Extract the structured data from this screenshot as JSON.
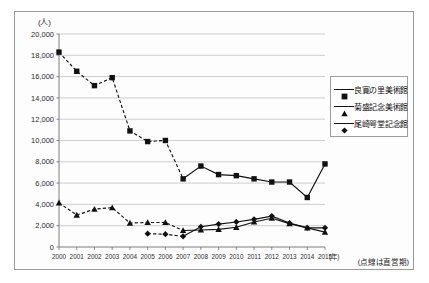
{
  "chart_data": {
    "type": "line",
    "title": "",
    "xlabel": "年",
    "ylabel": "人",
    "y_unit_label": "(人)",
    "x_unit_label": "(年)",
    "ylim": [
      0,
      20000
    ],
    "ytick_step": 2000,
    "grid": true,
    "legend_position": "right",
    "annotation": "(点線は直線期)",
    "note": "(点線は直営期)",
    "categories": [
      "2000",
      "2001",
      "2002",
      "2003",
      "2004",
      "2005",
      "2006",
      "2007",
      "2008",
      "2009",
      "2010",
      "2011",
      "2012",
      "2013",
      "2014",
      "2015"
    ],
    "ytick_labels": [
      "0",
      "2,000",
      "4,000",
      "6,000",
      "8,000",
      "10,000",
      "12,000",
      "14,000",
      "16,000",
      "18,000",
      "20,000"
    ],
    "ytick_values": [
      0,
      2000,
      4000,
      6000,
      8000,
      10000,
      12000,
      14000,
      16000,
      18000,
      20000
    ],
    "dashed_until_index": 7,
    "series": [
      {
        "name": "良寛の里美術館",
        "marker": "square",
        "values": [
          18300,
          16500,
          15150,
          15900,
          10900,
          9900,
          10000,
          6400,
          7600,
          6800,
          6700,
          6400,
          6100,
          6100,
          4650,
          7800
        ]
      },
      {
        "name": "菊盛記念美術館",
        "marker": "triangle",
        "values": [
          4150,
          3000,
          3550,
          3700,
          2250,
          2300,
          2300,
          1550,
          1600,
          1650,
          1850,
          2350,
          2700,
          2200,
          1800,
          1400
        ]
      },
      {
        "name": "尾崎咢堂記念館",
        "marker": "diamond",
        "values": [
          null,
          null,
          null,
          null,
          null,
          1250,
          1200,
          1000,
          1900,
          2150,
          2350,
          2600,
          2900,
          2250,
          1800,
          1800
        ]
      }
    ]
  },
  "legend": {
    "items": [
      {
        "label": "良寛の里美術館",
        "marker": "square"
      },
      {
        "label": "菊盛記念美術館",
        "marker": "triangle"
      },
      {
        "label": "尾崎咢堂記念館",
        "marker": "diamond"
      }
    ]
  }
}
